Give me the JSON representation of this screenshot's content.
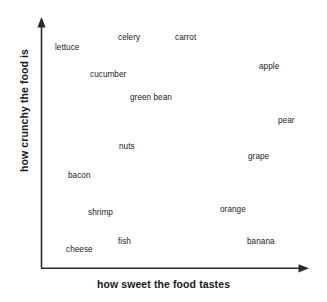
{
  "chart_data": {
    "type": "scatter",
    "title": "",
    "xlabel": "how sweet the food tastes",
    "ylabel": "how crunchy the food is",
    "grid": false,
    "legend": null,
    "axis_style": "arrow",
    "xlim": [
      0,
      100
    ],
    "ylim": [
      0,
      100
    ],
    "point_style": "text-label-only",
    "labels": [
      "lettuce",
      "celery",
      "carrot",
      "apple",
      "cucumber",
      "green bean",
      "pear",
      "nuts",
      "grape",
      "bacon",
      "shrimp",
      "orange",
      "fish",
      "cheese",
      "banana"
    ],
    "points": [
      {
        "label": "lettuce",
        "x": 7,
        "y": 93,
        "px": 55,
        "py": 44
      },
      {
        "label": "celery",
        "x": 31,
        "y": 97,
        "px": 118,
        "py": 34
      },
      {
        "label": "carrot",
        "x": 55,
        "y": 97,
        "px": 175,
        "py": 34
      },
      {
        "label": "apple",
        "x": 87,
        "y": 85,
        "px": 259,
        "py": 63
      },
      {
        "label": "cucumber",
        "x": 21,
        "y": 80,
        "px": 90,
        "py": 71
      },
      {
        "label": "green bean",
        "x": 36,
        "y": 71,
        "px": 130,
        "py": 94
      },
      {
        "label": "pear",
        "x": 94,
        "y": 62,
        "px": 278,
        "py": 117
      },
      {
        "label": "nuts",
        "x": 34,
        "y": 50,
        "px": 119,
        "py": 143
      },
      {
        "label": "grape",
        "x": 83,
        "y": 46,
        "px": 248,
        "py": 153
      },
      {
        "label": "bacon",
        "x": 12,
        "y": 38,
        "px": 68,
        "py": 172
      },
      {
        "label": "shrimp",
        "x": 21,
        "y": 24,
        "px": 88,
        "py": 209
      },
      {
        "label": "orange",
        "x": 74,
        "y": 25,
        "px": 220,
        "py": 206
      },
      {
        "label": "fish",
        "x": 32,
        "y": 11,
        "px": 118,
        "py": 238
      },
      {
        "label": "cheese",
        "x": 10,
        "y": 8,
        "px": 66,
        "py": 246
      },
      {
        "label": "banana",
        "x": 80,
        "y": 11,
        "px": 247,
        "py": 238
      }
    ],
    "colors": {
      "background": "#ffffff",
      "axis": "#2a2a2a",
      "label_text": "#222222",
      "axis_title_text": "#1a1a1a"
    },
    "axis_geometry": {
      "origin_px": [
        41,
        268
      ],
      "y_axis_top_px": [
        41,
        18
      ],
      "x_axis_right_px": [
        309,
        268
      ]
    }
  }
}
